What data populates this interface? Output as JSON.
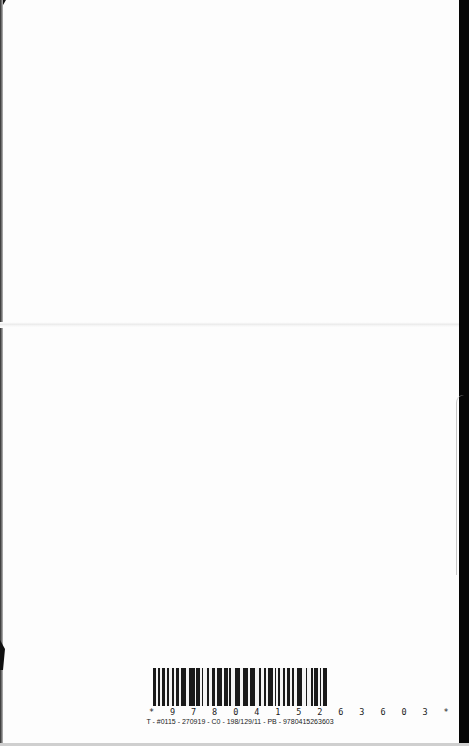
{
  "document": {
    "type": "book back cover (scanned)",
    "barcode": {
      "human_readable": "* 9 7 8 0 4 1 5 2 6 3 6 0 3 *",
      "caption": "T - #0115 - 270919 - C0 - 198/129/11 - PB - 9780415263603",
      "isbn": "9780415263603"
    }
  },
  "colors": {
    "page": "#fdfdfd",
    "edge": "#050505",
    "ink": "#222222"
  }
}
